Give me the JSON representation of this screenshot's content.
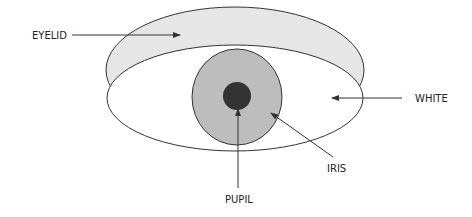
{
  "diagram": {
    "labels": {
      "eyelid": "EYELID",
      "white": "WHITE",
      "iris": "IRIS",
      "pupil": "PUPIL"
    },
    "colors": {
      "eyelid_fill": "#e6e6e6",
      "white_fill": "#ffffff",
      "iris_fill": "#bdbdbd",
      "pupil_fill": "#333333",
      "stroke": "#333333"
    }
  }
}
